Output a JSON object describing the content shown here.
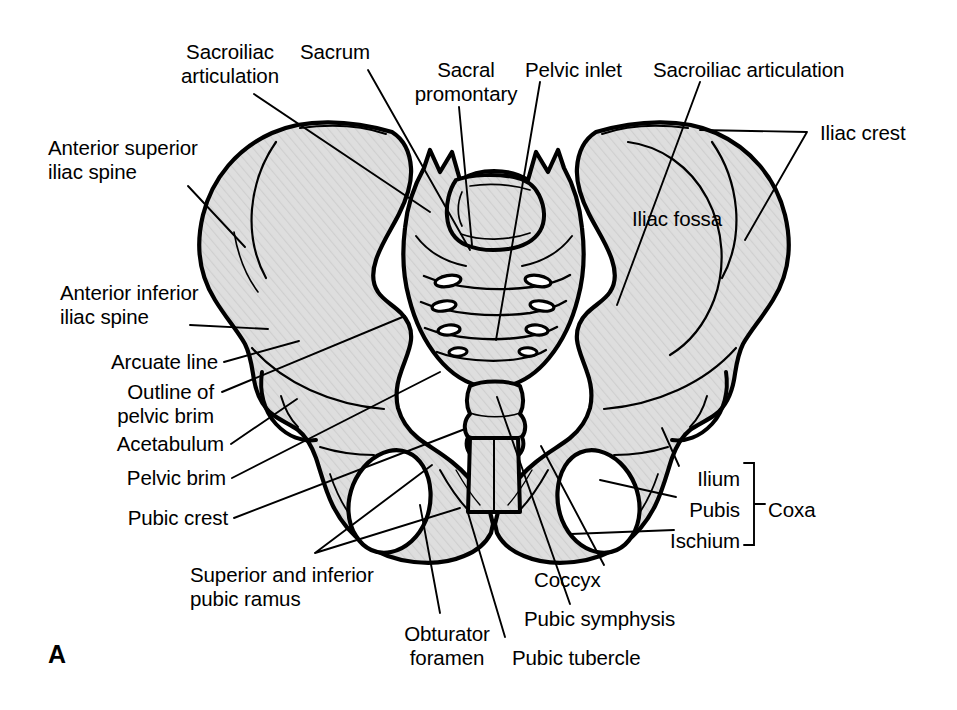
{
  "figure": {
    "panel_letter": "A",
    "background_color": "#ffffff",
    "bone_fill_color": "#dcdcdc",
    "bone_outline_color": "#000000",
    "leader_line_color": "#000000",
    "text_color": "#000000"
  },
  "labels": {
    "sacroiliac_articulation_left": "Sacroiliac\narticulation",
    "sacrum": "Sacrum",
    "sacral_promontary": "Sacral\npromontary",
    "pelvic_inlet": "Pelvic inlet",
    "sacroiliac_articulation_right": "Sacroiliac articulation",
    "iliac_crest": "Iliac crest",
    "iliac_fossa": "Iliac fossa",
    "anterior_superior_iliac_spine": "Anterior superior\niliac spine",
    "anterior_inferior_iliac_spine": "Anterior inferior\niliac spine",
    "arcuate_line": "Arcuate line",
    "outline_of_pelvic_brim": "Outline of\npelvic brim",
    "acetabulum": "Acetabulum",
    "pelvic_brim": "Pelvic brim",
    "pubic_crest": "Pubic crest",
    "superior_and_inferior_pubic_ramus": "Superior and inferior\npubic ramus",
    "obturator_foramen": "Obturator\nforamen",
    "pubic_tubercle": "Pubic tubercle",
    "pubic_symphysis": "Pubic symphysis",
    "coccyx": "Coccyx",
    "ilium": "Ilium",
    "pubis": "Pubis",
    "ischium": "Ischium",
    "coxa": "Coxa"
  },
  "bracket": {
    "groups_labels": [
      "Ilium",
      "Pubis",
      "Ischium"
    ],
    "group_name": "Coxa"
  },
  "structures": [
    "right hip bone (os coxae)",
    "left hip bone (os coxae)",
    "sacrum",
    "coccyx",
    "pubic symphysis",
    "obturator foramen (left)",
    "obturator foramen (right)",
    "iliac fossa (left)",
    "iliac fossa (right)",
    "acetabulum"
  ]
}
